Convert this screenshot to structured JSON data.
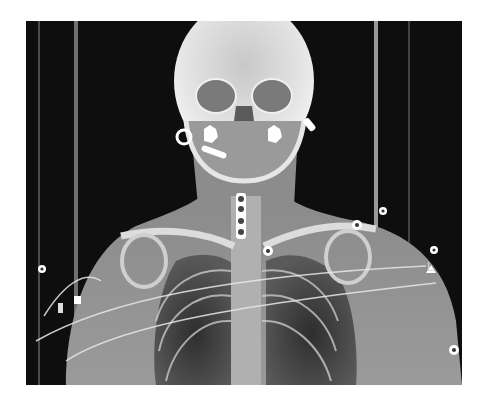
{
  "image": {
    "kind": "x-ray scout radiograph",
    "view": "frontal (AP) head, neck and chest",
    "laterality_marker": "L",
    "colors": {
      "background": "#0e0e0e",
      "soft_tissue": "#6a6a6a",
      "bone": "#e6e6e6",
      "metal": "#ffffff",
      "lung": "#3a3a3a"
    },
    "visible_features": [
      "skull",
      "orbits",
      "mandible with dental hardware",
      "bilateral ear markers",
      "cervical spine fixation plate",
      "clavicles",
      "shoulders",
      "lungs",
      "ECG electrodes",
      "monitoring leads",
      "table rails"
    ]
  }
}
